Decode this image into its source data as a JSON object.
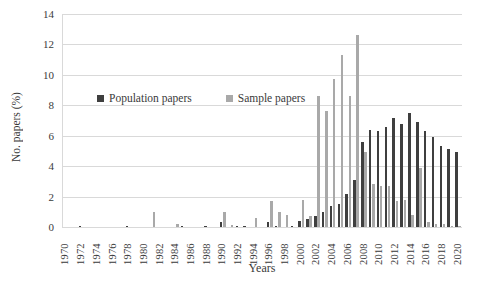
{
  "figure": {
    "background": "#ffffff",
    "text_color": "#3a3a3a",
    "grid_color": "#d9d9d9"
  },
  "chart_data": {
    "type": "bar",
    "title": "",
    "xlabel": "Years",
    "ylabel": "No. papers (%)",
    "ylim": [
      0,
      14
    ],
    "yticks": [
      0,
      2,
      4,
      6,
      8,
      10,
      12,
      14
    ],
    "grid": true,
    "legend_position": "inside-upper-left",
    "xtick_label_step": 2,
    "categories": [
      1970,
      1971,
      1972,
      1973,
      1974,
      1975,
      1976,
      1977,
      1978,
      1979,
      1980,
      1981,
      1982,
      1983,
      1984,
      1985,
      1986,
      1987,
      1988,
      1989,
      1990,
      1991,
      1992,
      1993,
      1994,
      1995,
      1996,
      1997,
      1998,
      1999,
      2000,
      2001,
      2002,
      2003,
      2004,
      2005,
      2006,
      2007,
      2008,
      2009,
      2010,
      2011,
      2012,
      2013,
      2014,
      2015,
      2016,
      2017,
      2018,
      2019,
      2020
    ],
    "series": [
      {
        "name": "Population papers",
        "color": "#3f3f3f",
        "values": [
          0,
          0,
          0.1,
          0,
          0,
          0,
          0,
          0,
          0.1,
          0,
          0,
          0,
          0,
          0,
          0,
          0.1,
          0,
          0,
          0.1,
          0,
          0.3,
          0,
          0.1,
          0.1,
          0,
          0,
          0.3,
          0.1,
          0,
          0.1,
          0.4,
          0.5,
          0.7,
          1.0,
          1.4,
          1.5,
          2.2,
          3.1,
          5.6,
          6.4,
          6.3,
          6.6,
          7.2,
          6.8,
          7.5,
          6.9,
          6.3,
          5.9,
          5.3,
          5.1,
          4.9
        ]
      },
      {
        "name": "Sample papers",
        "color": "#a9a9a9",
        "values": [
          0,
          0,
          0,
          0,
          0,
          0,
          0,
          0,
          0,
          0,
          0,
          1.0,
          0,
          0,
          0.2,
          0,
          0,
          0,
          0,
          0,
          1.0,
          0.15,
          0,
          0,
          0.6,
          0,
          1.7,
          1.0,
          0.8,
          0,
          1.8,
          0.7,
          8.6,
          7.6,
          9.7,
          11.3,
          8.6,
          12.6,
          4.9,
          2.8,
          2.7,
          2.7,
          1.7,
          1.8,
          0.8,
          3.9,
          0.3,
          0.2,
          0.2,
          0.1,
          0.1
        ]
      }
    ]
  }
}
